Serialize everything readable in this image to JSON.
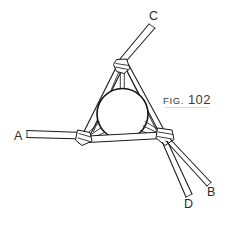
{
  "figure": {
    "caption_prefix": "Fig.",
    "caption_number": "102",
    "background_color": "#ffffff",
    "ink_color": "#1a1a1a",
    "width": 229,
    "height": 228
  },
  "labels": {
    "a": "A",
    "b": "B",
    "c": "C",
    "d": "D"
  },
  "elements": {
    "ring_name": "center-ring",
    "apex_node_name": "apex-lashing-node",
    "left_node_name": "left-lashing-node",
    "right_node_name": "right-lashing-node",
    "bottom_bar_name": "bottom-cross-bar"
  }
}
